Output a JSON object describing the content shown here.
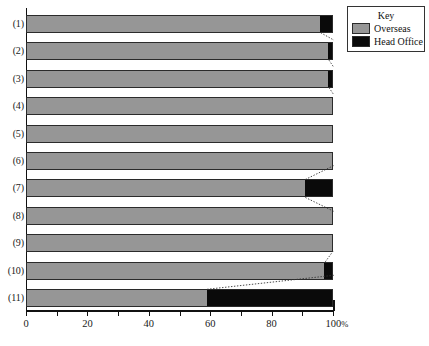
{
  "chart_data": {
    "type": "bar",
    "orientation": "horizontal",
    "stacked": true,
    "normalized_percent": true,
    "title": "",
    "subtitle": "",
    "xlabel": "",
    "ylabel": "",
    "xlim": [
      0,
      100
    ],
    "xticks": [
      0,
      10,
      20,
      30,
      40,
      50,
      60,
      70,
      80,
      90,
      100
    ],
    "xtick_labels": [
      "0",
      "",
      "20",
      "",
      "40",
      "",
      "60",
      "",
      "80",
      "",
      "100%"
    ],
    "grid": false,
    "legend": {
      "title": "Key",
      "position": "top-right",
      "entries": [
        {
          "name": "Overseas",
          "color": "#969696"
        },
        {
          "name": "Head Office",
          "color": "#0a0a0a"
        }
      ]
    },
    "categories": [
      "(1)",
      "(2)",
      "(3)",
      "(4)",
      "(5)",
      "(6)",
      "(7)",
      "(8)",
      "(9)",
      "(10)",
      "(11)"
    ],
    "series": [
      {
        "name": "Overseas",
        "color": "#969696",
        "values": [
          96.0,
          98.7,
          98.7,
          100.0,
          100.0,
          100.0,
          91.0,
          100.0,
          100.0,
          97.5,
          59.0
        ]
      },
      {
        "name": "Head Office",
        "color": "#0a0a0a",
        "values": [
          4.0,
          1.3,
          1.3,
          0.0,
          0.0,
          0.0,
          9.0,
          0.0,
          0.0,
          2.5,
          41.0
        ]
      }
    ],
    "annotations": [
      {
        "type": "leader-line",
        "style": "dotted",
        "for_category": "(1)"
      },
      {
        "type": "leader-line",
        "style": "dotted",
        "for_category": "(2)"
      },
      {
        "type": "leader-line",
        "style": "dotted",
        "for_category": "(3)"
      },
      {
        "type": "leader-line",
        "style": "dotted",
        "for_category": "(7)"
      },
      {
        "type": "leader-line",
        "style": "dotted",
        "for_category": "(10)"
      },
      {
        "type": "leader-line",
        "style": "dotted",
        "for_category": "(11)"
      }
    ]
  },
  "axis": {
    "x_tick_labels": [
      {
        "value": 0,
        "text": "0"
      },
      {
        "value": 20,
        "text": "20"
      },
      {
        "value": 40,
        "text": "40"
      },
      {
        "value": 60,
        "text": "60"
      },
      {
        "value": 80,
        "text": "80"
      },
      {
        "value": 100,
        "text": "100",
        "suffix": "%"
      }
    ]
  },
  "colors": {
    "overseas": "#969696",
    "head_office": "#0a0a0a",
    "axis": "#111111",
    "background": "#ffffff"
  }
}
